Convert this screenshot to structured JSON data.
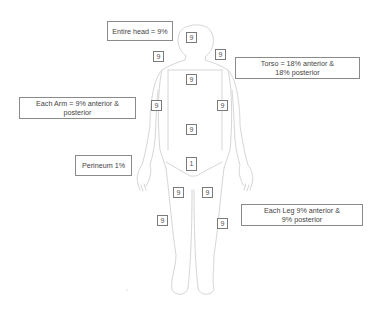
{
  "diagram": {
    "type": "rule-of-nines-body-chart",
    "outline_color": "#d8d8d8",
    "box_border_color": "#7a7a7a",
    "labels": {
      "head": "Entire head = 9%",
      "torso": "Torso = 18% anterior &\n18% posterior",
      "arm": "Each Arm = 9% anterior &\nposterior",
      "perineum": "Perineum 1%",
      "leg": "Each Leg 9% anterior &\n9% posterior"
    },
    "regions": {
      "head": "9",
      "left_shoulder": "9",
      "right_shoulder": "9",
      "chest": "9",
      "left_arm": "9",
      "right_arm": "9",
      "abdomen": "9",
      "perineum": "1",
      "left_thigh": "9",
      "right_thigh": "9",
      "left_leg": "9",
      "right_leg": "9"
    }
  }
}
